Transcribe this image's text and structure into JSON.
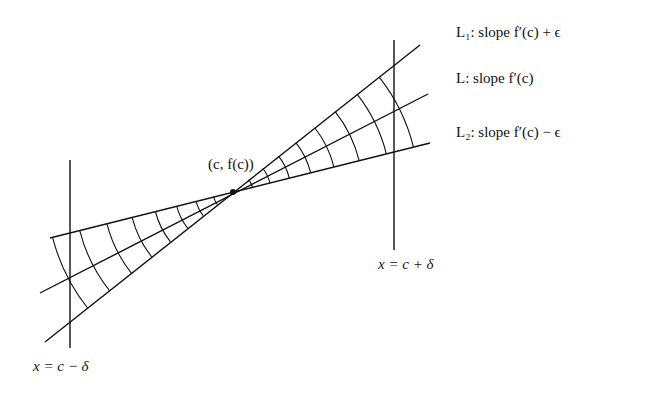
{
  "diagram": {
    "title": "",
    "center_point": {
      "label": "(c, f(c))",
      "x": 233,
      "y": 192
    },
    "lines": [
      {
        "id": "L1",
        "label": "L₁: slope f′(c) + ϵ",
        "name": "L1",
        "slope_desc": "slope f′(c) + ϵ"
      },
      {
        "id": "L",
        "label": "L: slope f′(c)",
        "name": "L",
        "slope_desc": "slope f′(c)"
      },
      {
        "id": "L2",
        "label": "L₂: slope f′(c) − ϵ",
        "name": "L2",
        "slope_desc": "slope f′(c) − ϵ"
      }
    ],
    "verticals": [
      {
        "id": "left",
        "label": "x = c − δ"
      },
      {
        "id": "right",
        "label": "x = c + δ"
      }
    ],
    "legend": {
      "l1": "L₁: slope f′(c) + ϵ",
      "l": "L: slope f′(c)",
      "l2": "L₂: slope f′(c) − ϵ"
    },
    "point_label": "(c, f(c))",
    "left_vertical_label": "x = c − δ",
    "right_vertical_label": "x = c + δ"
  }
}
